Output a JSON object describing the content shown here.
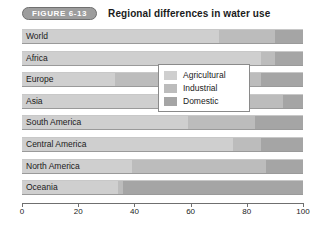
{
  "header": {
    "figure_label": "FIGURE 6-13",
    "title": "Regional differences in water use"
  },
  "chart_data": {
    "type": "bar",
    "orientation": "horizontal",
    "stacked": true,
    "title": "Regional differences in water use",
    "xlabel": "",
    "ylabel": "",
    "xlim": [
      0,
      100
    ],
    "xticks": [
      0,
      20,
      40,
      60,
      80,
      100
    ],
    "xtick_labels": [
      "0",
      "20",
      "40",
      "60",
      "80",
      "100"
    ],
    "grid": false,
    "legend_position": "center",
    "categories": [
      "World",
      "Africa",
      "Europe",
      "Asia",
      "South America",
      "Central America",
      "North America",
      "Oceania"
    ],
    "series": [
      {
        "name": "Agricultural",
        "color": "#cfcfcf",
        "values": [
          70,
          85,
          33,
          81,
          59,
          75,
          39,
          34
        ]
      },
      {
        "name": "Industrial",
        "color": "#bcbcbc",
        "values": [
          20,
          5,
          52,
          12,
          24,
          10,
          48,
          2
        ]
      },
      {
        "name": "Domestic",
        "color": "#a5a5a5",
        "values": [
          10,
          10,
          15,
          7,
          17,
          15,
          13,
          64
        ]
      }
    ]
  },
  "legend": {
    "items": [
      {
        "label": "Agricultural",
        "color": "#cfcfcf"
      },
      {
        "label": "Industrial",
        "color": "#bcbcbc"
      },
      {
        "label": "Domestic",
        "color": "#a5a5a5"
      }
    ]
  }
}
